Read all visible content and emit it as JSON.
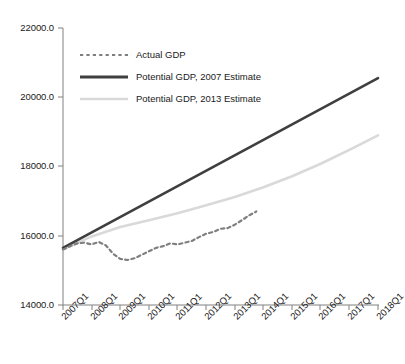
{
  "chart_data": {
    "type": "line",
    "title": "",
    "subtitle": "",
    "xlabel": "",
    "ylabel": "",
    "ylim": [
      14000.0,
      22000.0
    ],
    "y_ticks": [
      "14000.0",
      "16000.0",
      "18000.0",
      "20000.0",
      "22000.0"
    ],
    "y_tick_values": [
      14000.0,
      16000.0,
      18000.0,
      20000.0,
      22000.0
    ],
    "grid": false,
    "legend_position": "upper-left-inside",
    "categories": [
      "2007Q1",
      "2008Q1",
      "2009Q1",
      "2010Q1",
      "2011Q1",
      "2012Q1",
      "2013Q1",
      "2014Q1",
      "2015Q1",
      "2016Q1",
      "2017Q1",
      "2018Q1"
    ],
    "x_tick_labels": [
      "2007Q1",
      "2008Q1",
      "2009Q1",
      "2010Q1",
      "2011Q1",
      "2012Q1",
      "2013Q1",
      "2014Q1",
      "2015Q1",
      "2016Q1",
      "2017Q1",
      "2018Q1"
    ],
    "series": [
      {
        "name": "Actual GDP",
        "style": "dotted",
        "color": "#7f7f7f",
        "x": [
          "2007Q1",
          "2007Q2",
          "2007Q3",
          "2007Q4",
          "2008Q1",
          "2008Q2",
          "2008Q3",
          "2008Q4",
          "2009Q1",
          "2009Q2",
          "2009Q3",
          "2009Q4",
          "2010Q1",
          "2010Q2",
          "2010Q3",
          "2010Q4",
          "2011Q1",
          "2011Q2",
          "2011Q3",
          "2011Q4",
          "2012Q1",
          "2012Q2",
          "2012Q3",
          "2012Q4",
          "2013Q1",
          "2013Q2",
          "2013Q3",
          "2013Q4"
        ],
        "values": [
          15600,
          15700,
          15780,
          15800,
          15750,
          15820,
          15720,
          15480,
          15330,
          15300,
          15350,
          15450,
          15550,
          15650,
          15700,
          15780,
          15750,
          15800,
          15850,
          15960,
          16060,
          16110,
          16200,
          16220,
          16320,
          16450,
          16590,
          16700
        ]
      },
      {
        "name": "Potential GDP, 2007 Estimate",
        "style": "solid",
        "color": "#3f3f3f",
        "x": [
          "2007Q1",
          "2018Q1"
        ],
        "values": [
          15650,
          20550
        ]
      },
      {
        "name": "Potential GDP, 2013 Estimate",
        "style": "solid",
        "color": "#d9d9d9",
        "x": [
          "2007Q1",
          "2008Q1",
          "2009Q1",
          "2010Q1",
          "2011Q1",
          "2012Q1",
          "2013Q1",
          "2014Q1",
          "2015Q1",
          "2016Q1",
          "2017Q1",
          "2018Q1"
        ],
        "values": [
          15600,
          15980,
          16250,
          16450,
          16650,
          16880,
          17120,
          17400,
          17720,
          18080,
          18480,
          18900
        ]
      }
    ],
    "legend": [
      {
        "label": "Actual GDP",
        "color": "#7f7f7f",
        "style": "dotted"
      },
      {
        "label": "Potential GDP, 2007 Estimate",
        "color": "#3f3f3f",
        "style": "solid"
      },
      {
        "label": "Potential GDP, 2013 Estimate",
        "color": "#d9d9d9",
        "style": "solid"
      }
    ],
    "axis_color": "#808080"
  }
}
